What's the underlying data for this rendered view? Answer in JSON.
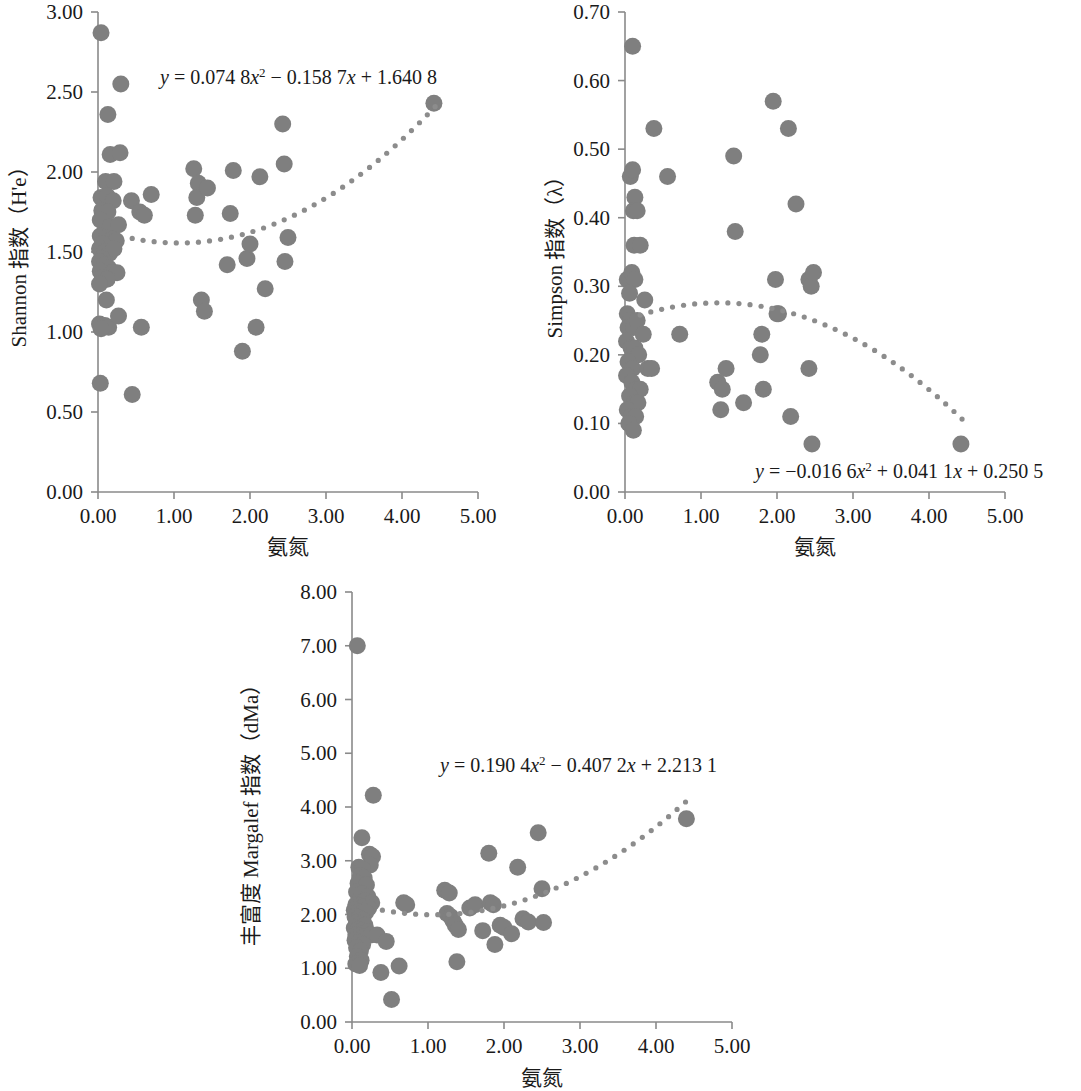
{
  "figure": {
    "panel_count": 3,
    "marker_color": "#7f7f7f",
    "trendline_color": "#8c8c8c",
    "axis_color": "#8a8a8a"
  },
  "chart_data": [
    {
      "id": "shannon",
      "type": "scatter",
      "title": "",
      "xlabel": "氨氮",
      "ylabel": "Shannon 指数（H'e）",
      "xlim": [
        0.0,
        5.0
      ],
      "ylim": [
        0.0,
        3.0
      ],
      "xticks": [
        "0.00",
        "1.00",
        "2.00",
        "3.00",
        "4.00",
        "5.00"
      ],
      "xtick_values": [
        0,
        1,
        2,
        3,
        4,
        5
      ],
      "yticks": [
        "0.00",
        "0.50",
        "1.00",
        "1.50",
        "2.00",
        "2.50",
        "3.00"
      ],
      "ytick_values": [
        0,
        0.5,
        1.0,
        1.5,
        2.0,
        2.5,
        3.0
      ],
      "grid": false,
      "legend": "none",
      "annotation": "y = 0.074 8x2 − 0.158 7x + 1.640 8",
      "annotation_parts": {
        "lhs": "y",
        "eq": " = 0.074 8",
        "x1": "x",
        "sup1": "2",
        "mid": " − 0.158 7",
        "x2": "x",
        "tail": " + 1.640 8"
      },
      "trend": {
        "type": "quadratic",
        "a": 0.0748,
        "b": -0.1587,
        "c": 1.6408,
        "x_start": 0.45,
        "x_end": 4.45
      },
      "points": [
        [
          0.04,
          2.87
        ],
        [
          0.3,
          2.55
        ],
        [
          0.13,
          2.36
        ],
        [
          0.16,
          2.11
        ],
        [
          0.29,
          2.12
        ],
        [
          0.1,
          1.94
        ],
        [
          0.21,
          1.94
        ],
        [
          0.04,
          1.84
        ],
        [
          0.12,
          1.85
        ],
        [
          0.2,
          1.82
        ],
        [
          0.05,
          1.76
        ],
        [
          0.13,
          1.75
        ],
        [
          0.03,
          1.7
        ],
        [
          0.16,
          1.66
        ],
        [
          0.27,
          1.67
        ],
        [
          0.03,
          1.6
        ],
        [
          0.11,
          1.59
        ],
        [
          0.19,
          1.58
        ],
        [
          0.24,
          1.57
        ],
        [
          0.06,
          1.55
        ],
        [
          0.02,
          1.52
        ],
        [
          0.09,
          1.5
        ],
        [
          0.15,
          1.49
        ],
        [
          0.21,
          1.52
        ],
        [
          0.05,
          1.46
        ],
        [
          0.02,
          1.44
        ],
        [
          0.08,
          1.42
        ],
        [
          0.14,
          1.4
        ],
        [
          0.03,
          1.38
        ],
        [
          0.19,
          1.37
        ],
        [
          0.25,
          1.37
        ],
        [
          0.06,
          1.34
        ],
        [
          0.12,
          1.33
        ],
        [
          0.02,
          1.3
        ],
        [
          0.02,
          1.05
        ],
        [
          0.09,
          1.04
        ],
        [
          0.14,
          1.03
        ],
        [
          0.04,
          1.02
        ],
        [
          0.11,
          1.2
        ],
        [
          0.27,
          1.1
        ],
        [
          0.03,
          0.68
        ],
        [
          0.45,
          0.61
        ],
        [
          0.57,
          1.03
        ],
        [
          0.44,
          1.82
        ],
        [
          0.55,
          1.75
        ],
        [
          0.61,
          1.73
        ],
        [
          0.7,
          1.86
        ],
        [
          1.26,
          2.02
        ],
        [
          1.32,
          1.93
        ],
        [
          1.3,
          1.84
        ],
        [
          1.28,
          1.73
        ],
        [
          1.44,
          1.9
        ],
        [
          1.36,
          1.2
        ],
        [
          1.4,
          1.13
        ],
        [
          1.78,
          2.01
        ],
        [
          1.74,
          1.74
        ],
        [
          1.7,
          1.42
        ],
        [
          1.9,
          0.88
        ],
        [
          1.96,
          1.46
        ],
        [
          2.0,
          1.55
        ],
        [
          2.13,
          1.97
        ],
        [
          2.2,
          1.27
        ],
        [
          2.08,
          1.03
        ],
        [
          2.43,
          2.3
        ],
        [
          2.45,
          2.05
        ],
        [
          2.5,
          1.59
        ],
        [
          2.46,
          1.44
        ],
        [
          4.42,
          2.43
        ]
      ]
    },
    {
      "id": "simpson",
      "type": "scatter",
      "title": "",
      "xlabel": "氨氮",
      "ylabel": "Simpson 指数（λ）",
      "xlim": [
        0.0,
        5.0
      ],
      "ylim": [
        0.0,
        0.7
      ],
      "xticks": [
        "0.00",
        "1.00",
        "2.00",
        "3.00",
        "4.00",
        "5.00"
      ],
      "xtick_values": [
        0,
        1,
        2,
        3,
        4,
        5
      ],
      "yticks": [
        "0.00",
        "0.10",
        "0.20",
        "0.30",
        "0.40",
        "0.50",
        "0.60",
        "0.70"
      ],
      "ytick_values": [
        0,
        0.1,
        0.2,
        0.3,
        0.4,
        0.5,
        0.6,
        0.7
      ],
      "grid": false,
      "legend": "none",
      "annotation": "y = −0.016 6x2 + 0.041 1x + 0.250 5",
      "annotation_parts": {
        "lhs": "y",
        "eq": " = −0.016 6",
        "x1": "x",
        "sup1": "2",
        "mid": " + 0.041 1",
        "x2": "x",
        "tail": " + 0.250 5"
      },
      "trend": {
        "type": "quadratic",
        "a": -0.0166,
        "b": 0.0411,
        "c": 0.2505,
        "x_start": 0.2,
        "x_end": 4.45
      },
      "points": [
        [
          0.1,
          0.65
        ],
        [
          0.38,
          0.53
        ],
        [
          0.07,
          0.46
        ],
        [
          0.1,
          0.47
        ],
        [
          0.13,
          0.43
        ],
        [
          0.11,
          0.41
        ],
        [
          0.16,
          0.41
        ],
        [
          0.12,
          0.36
        ],
        [
          0.2,
          0.36
        ],
        [
          0.03,
          0.31
        ],
        [
          0.09,
          0.32
        ],
        [
          0.13,
          0.31
        ],
        [
          0.06,
          0.29
        ],
        [
          0.03,
          0.26
        ],
        [
          0.07,
          0.25
        ],
        [
          0.04,
          0.24
        ],
        [
          0.11,
          0.24
        ],
        [
          0.16,
          0.25
        ],
        [
          0.02,
          0.22
        ],
        [
          0.08,
          0.21
        ],
        [
          0.13,
          0.21
        ],
        [
          0.18,
          0.2
        ],
        [
          0.04,
          0.19
        ],
        [
          0.1,
          0.18
        ],
        [
          0.02,
          0.17
        ],
        [
          0.09,
          0.16
        ],
        [
          0.15,
          0.15
        ],
        [
          0.2,
          0.15
        ],
        [
          0.06,
          0.14
        ],
        [
          0.12,
          0.13
        ],
        [
          0.17,
          0.13
        ],
        [
          0.03,
          0.12
        ],
        [
          0.08,
          0.11
        ],
        [
          0.14,
          0.11
        ],
        [
          0.05,
          0.1
        ],
        [
          0.11,
          0.09
        ],
        [
          0.26,
          0.28
        ],
        [
          0.24,
          0.23
        ],
        [
          0.3,
          0.18
        ],
        [
          0.35,
          0.18
        ],
        [
          0.56,
          0.46
        ],
        [
          0.72,
          0.23
        ],
        [
          1.22,
          0.16
        ],
        [
          1.28,
          0.15
        ],
        [
          1.26,
          0.12
        ],
        [
          1.33,
          0.18
        ],
        [
          1.43,
          0.49
        ],
        [
          1.45,
          0.38
        ],
        [
          1.56,
          0.13
        ],
        [
          1.8,
          0.23
        ],
        [
          1.78,
          0.2
        ],
        [
          1.82,
          0.15
        ],
        [
          1.95,
          0.57
        ],
        [
          1.98,
          0.31
        ],
        [
          2.0,
          0.26
        ],
        [
          2.02,
          0.26
        ],
        [
          2.15,
          0.53
        ],
        [
          2.18,
          0.11
        ],
        [
          2.25,
          0.42
        ],
        [
          2.42,
          0.31
        ],
        [
          2.45,
          0.3
        ],
        [
          2.48,
          0.32
        ],
        [
          2.42,
          0.18
        ],
        [
          2.46,
          0.07
        ],
        [
          4.42,
          0.07
        ]
      ]
    },
    {
      "id": "margalef",
      "type": "scatter",
      "title": "",
      "xlabel": "氨氮",
      "ylabel": "丰富度 Margalef 指数（dMa）",
      "xlim": [
        0.0,
        5.0
      ],
      "ylim": [
        0.0,
        8.0
      ],
      "xticks": [
        "0.00",
        "1.00",
        "2.00",
        "3.00",
        "4.00",
        "5.00"
      ],
      "xtick_values": [
        0,
        1,
        2,
        3,
        4,
        5
      ],
      "yticks": [
        "0.00",
        "1.00",
        "2.00",
        "3.00",
        "4.00",
        "5.00",
        "6.00",
        "7.00",
        "8.00"
      ],
      "ytick_values": [
        0,
        1,
        2,
        3,
        4,
        5,
        6,
        7,
        8
      ],
      "grid": false,
      "legend": "none",
      "annotation": "y = 0.190 4x2 − 0.407 2x + 2.213 1",
      "annotation_parts": {
        "lhs": "y",
        "eq": " = 0.190 4",
        "x1": "x",
        "sup1": "2",
        "mid": " − 0.407 2",
        "x2": "x",
        "tail": " + 2.213 1"
      },
      "trend": {
        "type": "quadratic",
        "a": 0.1904,
        "b": -0.4072,
        "c": 2.2131,
        "x_start": 0.4,
        "x_end": 4.4
      },
      "points": [
        [
          0.07,
          7.0
        ],
        [
          0.28,
          4.22
        ],
        [
          0.13,
          3.43
        ],
        [
          0.23,
          3.12
        ],
        [
          0.27,
          3.08
        ],
        [
          0.24,
          2.92
        ],
        [
          0.09,
          2.88
        ],
        [
          0.14,
          2.84
        ],
        [
          0.11,
          2.72
        ],
        [
          0.16,
          2.68
        ],
        [
          0.08,
          2.58
        ],
        [
          0.19,
          2.55
        ],
        [
          0.06,
          2.42
        ],
        [
          0.13,
          2.38
        ],
        [
          0.21,
          2.33
        ],
        [
          0.17,
          2.25
        ],
        [
          0.26,
          2.22
        ],
        [
          0.05,
          2.18
        ],
        [
          0.1,
          2.16
        ],
        [
          0.15,
          2.14
        ],
        [
          0.22,
          2.12
        ],
        [
          0.03,
          2.08
        ],
        [
          0.08,
          2.05
        ],
        [
          0.13,
          2.02
        ],
        [
          0.18,
          2.04
        ],
        [
          0.04,
          1.96
        ],
        [
          0.09,
          1.93
        ],
        [
          0.14,
          1.9
        ],
        [
          0.06,
          1.85
        ],
        [
          0.11,
          1.82
        ],
        [
          0.17,
          1.8
        ],
        [
          0.03,
          1.75
        ],
        [
          0.08,
          1.72
        ],
        [
          0.13,
          1.7
        ],
        [
          0.2,
          1.68
        ],
        [
          0.05,
          1.62
        ],
        [
          0.1,
          1.6
        ],
        [
          0.16,
          1.58
        ],
        [
          0.25,
          1.62
        ],
        [
          0.04,
          1.52
        ],
        [
          0.09,
          1.48
        ],
        [
          0.14,
          1.44
        ],
        [
          0.06,
          1.38
        ],
        [
          0.11,
          1.32
        ],
        [
          0.07,
          1.22
        ],
        [
          0.12,
          1.15
        ],
        [
          0.05,
          1.08
        ],
        [
          0.1,
          1.05
        ],
        [
          0.33,
          1.62
        ],
        [
          0.38,
          0.92
        ],
        [
          0.45,
          1.5
        ],
        [
          0.52,
          0.42
        ],
        [
          0.62,
          1.04
        ],
        [
          0.68,
          2.22
        ],
        [
          0.72,
          2.18
        ],
        [
          1.22,
          2.45
        ],
        [
          1.28,
          2.4
        ],
        [
          1.25,
          2.02
        ],
        [
          1.3,
          1.96
        ],
        [
          1.33,
          1.88
        ],
        [
          1.36,
          1.8
        ],
        [
          1.4,
          1.72
        ],
        [
          1.38,
          1.12
        ],
        [
          1.55,
          2.12
        ],
        [
          1.62,
          2.18
        ],
        [
          1.72,
          1.7
        ],
        [
          1.8,
          3.14
        ],
        [
          1.82,
          2.22
        ],
        [
          1.86,
          2.18
        ],
        [
          1.88,
          1.44
        ],
        [
          1.95,
          1.8
        ],
        [
          2.0,
          1.76
        ],
        [
          2.1,
          1.64
        ],
        [
          2.18,
          2.88
        ],
        [
          2.25,
          1.92
        ],
        [
          2.32,
          1.86
        ],
        [
          2.45,
          3.52
        ],
        [
          2.5,
          2.48
        ],
        [
          2.52,
          1.85
        ],
        [
          4.4,
          3.78
        ]
      ]
    }
  ]
}
